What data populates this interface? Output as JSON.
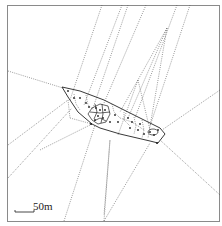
{
  "figure": {
    "type": "voronoi-tessellation-map",
    "scale_bar": {
      "label": "50m"
    },
    "colors": {
      "frame": "#8a8a8a",
      "lines": "#555555",
      "points": "#222222",
      "background": "#ffffff"
    }
  }
}
